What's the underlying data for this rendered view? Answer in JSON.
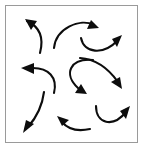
{
  "figure": {
    "background_color": "#ffffff",
    "frame_color": "#9a9a9a",
    "arrow_color": "#0d0d0d",
    "frame": {
      "x": 5,
      "y": 5,
      "width": 133,
      "height": 138
    },
    "arrow_count": 9,
    "arrows": [
      {
        "id": "arrow-top-left",
        "label": "top-left arrow pointing up-left",
        "direction": "up-left",
        "curve": "M 40 53 C 44 38 40 27 27 21",
        "head": "25 19 37 21 31 30",
        "stroke_width": 2.1
      },
      {
        "id": "arrow-top-center",
        "label": "top-center arrow pointing right",
        "direction": "right",
        "curve": "M 54 48 C 56 28 80 18 94 25",
        "head": "99 28 87 29 91 20",
        "stroke_width": 2.1
      },
      {
        "id": "arrow-top-right",
        "label": "top-right arrow pointing up-right",
        "direction": "up-right",
        "curve": "M 81 38 C 84 53 103 56 118 40",
        "head": "122 35 117 47 112 39",
        "stroke_width": 2.1
      },
      {
        "id": "arrow-middle-left",
        "label": "middle-left arrow pointing left",
        "direction": "left",
        "curve": "M 54 93 C 58 77 48 68 33 68",
        "head": "21 68 34 63 34 74",
        "stroke_width": 2.1
      },
      {
        "id": "arrow-center",
        "label": "center arrow pointing right-down",
        "direction": "right-down",
        "curve": "M 93 60 C 70 58 63 74 78 88",
        "head": "87 94 75 93 81 84",
        "stroke_width": 2.1
      },
      {
        "id": "arrow-middle-right",
        "label": "middle-right arrow pointing down-right",
        "direction": "down-right",
        "curve": "M 80 58 C 95 59 108 68 118 82",
        "head": "122 89 111 82 120 77",
        "stroke_width": 2.1
      },
      {
        "id": "arrow-bottom-left",
        "label": "bottom-left arrow pointing down-left",
        "direction": "down-left",
        "curve": "M 44 92 C 42 108 36 118 28 127",
        "head": "23 133 26 120 34 124",
        "stroke_width": 2.1
      },
      {
        "id": "arrow-bottom-center",
        "label": "bottom-center arrow pointing up-left",
        "direction": "up-left",
        "curve": "M 90 129 C 76 132 67 128 62 122",
        "head": "57 116 69 120 62 126",
        "stroke_width": 2.1
      },
      {
        "id": "arrow-bottom-right",
        "label": "bottom-right arrow pointing up-right",
        "direction": "up-right",
        "curve": "M 96 106 C 96 124 113 128 126 112",
        "head": "130 106 126 119 120 111",
        "stroke_width": 2.1
      }
    ]
  }
}
